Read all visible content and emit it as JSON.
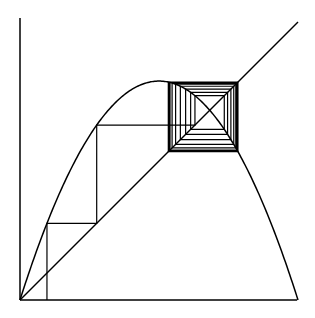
{
  "diagram": {
    "type": "cobweb-plot",
    "map": "logistic",
    "r": 3.15,
    "x0": 0.097,
    "iterations": 160,
    "colors": {
      "stroke": "#000000",
      "background": "#ffffff"
    },
    "frame": {
      "origin_px": [
        20,
        300
      ],
      "x_end_px": 297,
      "y_top_px": 18,
      "scale_px": 278
    },
    "elements": [
      "y-axis",
      "x-axis",
      "diagonal-line-y-equals-x",
      "parabola-curve",
      "cobweb-path"
    ]
  }
}
